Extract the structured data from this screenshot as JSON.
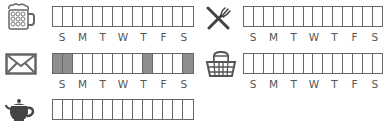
{
  "colors": {
    "line": "#666666",
    "shaded": "#8e8e8e",
    "label": "#555555"
  },
  "days": [
    "S",
    "M",
    "T",
    "W",
    "T",
    "F",
    "S"
  ],
  "trackers": [
    {
      "id": "beer",
      "icon": "beer-mug-icon",
      "cells": [
        0,
        0,
        0,
        0,
        0,
        0,
        0,
        0,
        0,
        0,
        0,
        0,
        0,
        0
      ],
      "show_days": true
    },
    {
      "id": "dining",
      "icon": "fork-knife-icon",
      "cells": [
        0,
        0,
        0,
        0,
        0,
        0,
        0,
        0,
        0,
        0,
        0,
        0,
        0,
        0
      ],
      "show_days": true
    },
    {
      "id": "mail",
      "icon": "envelope-icon",
      "cells": [
        1,
        1,
        0,
        0,
        0,
        0,
        0,
        0,
        0,
        1,
        0,
        0,
        0,
        1
      ],
      "show_days": true
    },
    {
      "id": "picnic",
      "icon": "picnic-basket-icon",
      "cells": [
        0,
        0,
        0,
        0,
        0,
        0,
        0,
        0,
        0,
        0,
        0,
        0,
        0,
        0
      ],
      "show_days": true
    },
    {
      "id": "tea",
      "icon": "teapot-icon",
      "cells": [
        0,
        0,
        0,
        0,
        0,
        0,
        0,
        0,
        0,
        0,
        0,
        0,
        0,
        0
      ],
      "show_days": false
    }
  ]
}
